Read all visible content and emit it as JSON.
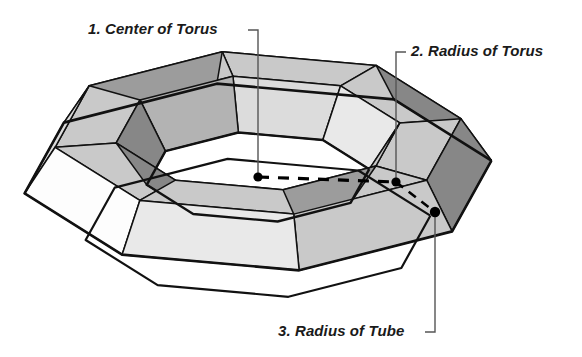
{
  "figure": {
    "title_alt": "Faceted torus diagram",
    "background_color": "#ffffff",
    "stroke_color": "#111111",
    "palette": {
      "white": "#fdfdfd",
      "light": "#e9e9e9",
      "light2": "#dcdcdc",
      "mid_light": "#c9c9c9",
      "mid": "#b3b3b3",
      "mid_dark": "#9c9c9c",
      "dark": "#878787",
      "darker": "#757575"
    },
    "dot_color": "#000000",
    "leader_color": "#555555",
    "dash_color": "#000000"
  },
  "callouts": [
    {
      "id": "center-of-torus",
      "number": "1.",
      "text": "1. Center of Torus",
      "label_x": 88,
      "label_y": 20,
      "leader": [
        [
          248,
          30
        ],
        [
          258,
          30
        ],
        [
          258,
          177
        ]
      ],
      "dot": {
        "x": 258,
        "y": 177,
        "r": 4.6
      }
    },
    {
      "id": "radius-of-torus",
      "number": "2.",
      "text": "2. Radius of Torus",
      "label_x": 411,
      "label_y": 42,
      "leader": [
        [
          406,
          52
        ],
        [
          396,
          52
        ],
        [
          396,
          182
        ]
      ],
      "dot": {
        "x": 396,
        "y": 182,
        "r": 4.6
      }
    },
    {
      "id": "radius-of-tube",
      "number": "3.",
      "text": "3. Radius of Tube",
      "label_x": 278,
      "label_y": 322,
      "leader": [
        [
          425,
          332
        ],
        [
          435,
          332
        ],
        [
          435,
          212
        ]
      ],
      "dot": {
        "x": 435,
        "y": 212,
        "r": 5.2
      }
    }
  ],
  "measure_lines": [
    {
      "id": "torus-radius-dashed",
      "from": [
        258,
        177
      ],
      "to": [
        396,
        182
      ],
      "dash": "11 9",
      "width": 3.2
    },
    {
      "id": "tube-radius-dashed",
      "from": [
        396,
        182
      ],
      "to": [
        435,
        212
      ],
      "dash": "9 7",
      "width": 2.6
    }
  ],
  "torus_geometry": {
    "type": "faceted-torus",
    "major_segments": 8,
    "minor_segments": 6,
    "center_x": 258,
    "center_y": 177,
    "major_radius": 175,
    "tube_radius": 62,
    "y_squash": 0.4,
    "tube_y_squash": 0.82,
    "rotation_deg": 10,
    "light_dir": [
      -0.55,
      -0.62,
      0.56
    ]
  },
  "chart_data": {
    "type": "table",
    "columns": [
      "#",
      "Parameter"
    ],
    "rows": [
      [
        "1",
        "Center of Torus"
      ],
      [
        "2",
        "Radius of Torus"
      ],
      [
        "3",
        "Radius of Tube"
      ]
    ]
  }
}
